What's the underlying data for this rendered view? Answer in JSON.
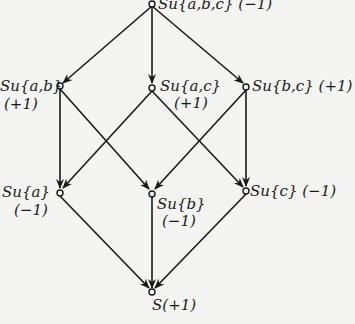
{
  "diagram": {
    "type": "lattice",
    "nodes": [
      {
        "id": "abc",
        "label": "Su{a,b,c}",
        "sign": "(−1)"
      },
      {
        "id": "ab",
        "label": "Su{a,b}",
        "sign": "(+1)"
      },
      {
        "id": "ac",
        "label": "Su{a,c}",
        "sign": "(+1)"
      },
      {
        "id": "bc",
        "label": "Su{b,c}",
        "sign": "(+1)"
      },
      {
        "id": "a",
        "label": "Su{a}",
        "sign": "(−1)"
      },
      {
        "id": "b",
        "label": "Su{b}",
        "sign": "(−1)"
      },
      {
        "id": "c",
        "label": "Su{c}",
        "sign": "(−1)"
      },
      {
        "id": "s",
        "label": "S",
        "sign": "(+1)"
      }
    ],
    "edges": [
      [
        "abc",
        "ab"
      ],
      [
        "abc",
        "ac"
      ],
      [
        "abc",
        "bc"
      ],
      [
        "ab",
        "a"
      ],
      [
        "ab",
        "b"
      ],
      [
        "ac",
        "a"
      ],
      [
        "ac",
        "c"
      ],
      [
        "bc",
        "b"
      ],
      [
        "bc",
        "c"
      ],
      [
        "a",
        "s"
      ],
      [
        "b",
        "s"
      ],
      [
        "c",
        "s"
      ]
    ],
    "colors": {
      "ink": "#1a1a1a",
      "paper": "#f4f4f2"
    }
  }
}
